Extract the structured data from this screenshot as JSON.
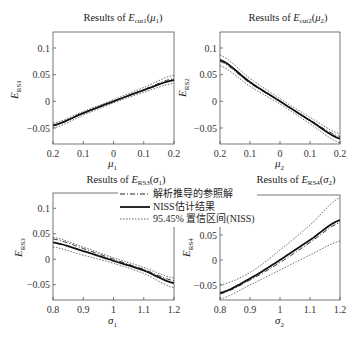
{
  "chart_data": [
    {
      "type": "line",
      "title": "Results of E_cut1(μ1)",
      "title_parts": {
        "prefix": "Results of ",
        "sym": "E",
        "sub": "cut1",
        "arg": "μ",
        "arg_sub": "1"
      },
      "xlabel": "μ1",
      "ylabel": "E_RS1",
      "xlim": [
        -0.2,
        0.2
      ],
      "ylim": [
        -0.08,
        0.13
      ],
      "xticks": [
        -0.2,
        -0.1,
        0,
        0.1,
        0.2
      ],
      "xtick_labels": [
        "0.2",
        "0.1",
        "0",
        "0.1",
        "0.2"
      ],
      "yticks": [
        -0.05,
        0,
        0.05,
        0.1
      ],
      "ytick_labels": [
        "−0.05",
        "0",
        "0.05",
        "0.1"
      ],
      "x": [
        -0.2,
        -0.1,
        0,
        0.1,
        0.2
      ],
      "series": [
        {
          "name": "解析推导的参照解",
          "style": "dashdot",
          "values": [
            -0.046,
            -0.022,
            0.0,
            0.022,
            0.043
          ]
        },
        {
          "name": "NISS估计结果",
          "style": "solid",
          "values": [
            -0.045,
            -0.022,
            0.0,
            0.021,
            0.04
          ]
        },
        {
          "name": "95.45% 置信区间(NISS) upper",
          "style": "dotted",
          "values": [
            -0.041,
            -0.019,
            0.003,
            0.026,
            0.049
          ]
        },
        {
          "name": "95.45% 置信区间(NISS) lower",
          "style": "dotted",
          "values": [
            -0.05,
            -0.026,
            -0.003,
            0.017,
            0.034
          ]
        }
      ]
    },
    {
      "type": "line",
      "title": "Results of E_cut2(μ2)",
      "title_parts": {
        "prefix": "Results of ",
        "sym": "E",
        "sub": "cut2",
        "arg": "μ",
        "arg_sub": "2"
      },
      "xlabel": "μ2",
      "ylabel": "E_RS2",
      "xlim": [
        -0.2,
        0.2
      ],
      "ylim": [
        -0.08,
        0.13
      ],
      "xticks": [
        -0.2,
        -0.1,
        0,
        0.1,
        0.2
      ],
      "xtick_labels": [
        "0.2",
        "0.1",
        "0",
        "0.1",
        "0.2"
      ],
      "yticks": [
        -0.05,
        0,
        0.05,
        0.1
      ],
      "ytick_labels": [
        "−0.05",
        "0",
        "0.05",
        "0.1"
      ],
      "x": [
        -0.2,
        -0.1,
        0,
        0.1,
        0.2
      ],
      "series": [
        {
          "name": "解析推导的参照解",
          "style": "dashdot",
          "values": [
            0.075,
            0.034,
            0.0,
            -0.035,
            -0.066
          ]
        },
        {
          "name": "NISS估计结果",
          "style": "solid",
          "values": [
            0.078,
            0.036,
            0.0,
            -0.036,
            -0.07
          ]
        },
        {
          "name": "95.45% 置信区间(NISS) upper",
          "style": "dotted",
          "values": [
            0.087,
            0.043,
            0.005,
            -0.03,
            -0.061
          ]
        },
        {
          "name": "95.45% 置信区间(NISS) lower",
          "style": "dotted",
          "values": [
            0.067,
            0.028,
            -0.005,
            -0.042,
            -0.078
          ]
        }
      ]
    },
    {
      "type": "line",
      "title": "Results of E_RS3(σ1)",
      "title_parts": {
        "prefix": "Results of ",
        "sym": "E",
        "sub": "RS3",
        "arg": "σ",
        "arg_sub": "1"
      },
      "xlabel": "σ1",
      "ylabel": "E_RS3",
      "xlim": [
        0.8,
        1.2
      ],
      "ylim": [
        -0.08,
        0.13
      ],
      "xticks": [
        0.8,
        0.9,
        1.0,
        1.1,
        1.2
      ],
      "xtick_labels": [
        "0.8",
        "0.9",
        "1",
        "1.1",
        "1.2"
      ],
      "yticks": [
        -0.05,
        0,
        0.05,
        0.1
      ],
      "ytick_labels": [
        "−0.05",
        "0",
        "0.05",
        "0.1"
      ],
      "x": [
        0.8,
        0.9,
        1.0,
        1.1,
        1.2
      ],
      "series": [
        {
          "name": "解析推导的参照解",
          "style": "dashdot",
          "values": [
            0.04,
            0.021,
            0.0,
            -0.02,
            -0.042
          ]
        },
        {
          "name": "NISS估计结果",
          "style": "solid",
          "values": [
            0.033,
            0.016,
            -0.003,
            -0.022,
            -0.047
          ]
        },
        {
          "name": "95.45% 置信区间(NISS) upper",
          "style": "dotted",
          "values": [
            0.043,
            0.024,
            0.003,
            -0.016,
            -0.037
          ]
        },
        {
          "name": "95.45% 置信区间(NISS) lower",
          "style": "dotted",
          "values": [
            0.024,
            0.008,
            -0.008,
            -0.028,
            -0.056
          ]
        }
      ]
    },
    {
      "type": "line",
      "title": "Results of E_RS4(σ2)",
      "title_parts": {
        "prefix": "Results of ",
        "sym": "E",
        "sub": "RS4",
        "arg": "σ",
        "arg_sub": "2"
      },
      "xlabel": "σ2",
      "ylabel": "E_RS4",
      "xlim": [
        0.8,
        1.2
      ],
      "ylim": [
        -0.08,
        0.13
      ],
      "xticks": [
        0.8,
        0.9,
        1.0,
        1.1,
        1.2
      ],
      "xtick_labels": [
        "0.8",
        "0.9",
        "1",
        "1.1",
        "1.2"
      ],
      "yticks": [
        -0.05,
        0,
        0.05
      ],
      "ytick_labels": [
        "−0.05",
        "0",
        "0.05"
      ],
      "x": [
        0.8,
        0.9,
        1.0,
        1.1,
        1.2
      ],
      "series": [
        {
          "name": "解析推导的参照解",
          "style": "dashdot",
          "values": [
            -0.068,
            -0.04,
            -0.005,
            0.035,
            0.075
          ]
        },
        {
          "name": "NISS估计结果",
          "style": "solid",
          "values": [
            -0.066,
            -0.037,
            0.0,
            0.04,
            0.08
          ]
        },
        {
          "name": "95.45% 置信区间(NISS) upper",
          "style": "dotted",
          "values": [
            -0.05,
            -0.025,
            0.02,
            0.07,
            0.125
          ]
        },
        {
          "name": "95.45% 置信区间(NISS) lower",
          "style": "dotted",
          "values": [
            -0.078,
            -0.05,
            -0.02,
            0.01,
            0.038
          ]
        }
      ]
    }
  ],
  "legend": {
    "entries": [
      {
        "label": "解析推导的参照解",
        "style": "dashdot"
      },
      {
        "label": "NISS估计结果",
        "style": "solid"
      },
      {
        "label": "95.45% 置信区间(NISS)",
        "style": "dotted"
      }
    ],
    "position": "over bottom-left panel, top-right"
  },
  "colors": {
    "line": "#222222",
    "axis": "#555555",
    "background": "#ffffff"
  }
}
